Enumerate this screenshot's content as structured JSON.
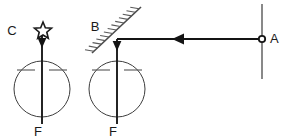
{
  "figure": {
    "background_color": "#ffffff",
    "line_color": "#141414",
    "thin_line_color": "#3d3d3d",
    "label_color": "#1a1a1a",
    "width": 286,
    "height": 140
  },
  "labels": {
    "source_label": "C",
    "mirror_label": "B",
    "object_label": "A",
    "focus_left_label": "F",
    "focus_right_label": "F"
  },
  "elements": {
    "star": {
      "name": "star-source",
      "cx": 43,
      "cy": 31,
      "outer_r": 9,
      "inner_r": 4,
      "points": 5
    },
    "left_lens": {
      "name": "left-lens-circle",
      "cx": 42,
      "cy": 89,
      "r": 28,
      "axis_top": 36,
      "axis_bottom": 124,
      "dash_y": 70,
      "dash_left": [
        17,
        35
      ],
      "dash_right": [
        49,
        67
      ]
    },
    "right_lens": {
      "name": "right-lens-circle",
      "cx": 117,
      "cy": 89,
      "r": 28,
      "axis_top": 39,
      "axis_bottom": 124,
      "dash_y": 70,
      "dash_left": [
        92,
        110
      ],
      "dash_right": [
        124,
        142
      ]
    },
    "mirror": {
      "name": "plane-mirror",
      "x1": 92,
      "y1": 53,
      "x2": 141,
      "y2": 7,
      "hatch_count": 13,
      "hatch_len": 9
    },
    "horizontal_ray": {
      "name": "incident-ray",
      "x1": 117,
      "x2": 262,
      "y": 39,
      "arrow_x": 182,
      "arrow_dir": "left"
    },
    "object_line": {
      "name": "object-vertical-line",
      "x": 262,
      "y1": 4,
      "y2": 79
    },
    "object_dot": {
      "name": "object-point-A",
      "cx": 262,
      "cy": 39,
      "r": 3.2
    },
    "left_arrowhead": {
      "name": "left-axis-arrowhead",
      "x": 42,
      "y": 45,
      "dir": "down"
    },
    "right_arrowhead": {
      "name": "right-axis-arrowhead",
      "x": 117,
      "y": 48,
      "dir": "down"
    }
  },
  "label_positions": {
    "C": {
      "x": 12,
      "y": 35
    },
    "B": {
      "x": 95,
      "y": 31
    },
    "A": {
      "x": 270,
      "y": 43
    },
    "F_left": {
      "x": 38,
      "y": 136
    },
    "F_right": {
      "x": 113,
      "y": 136
    }
  }
}
